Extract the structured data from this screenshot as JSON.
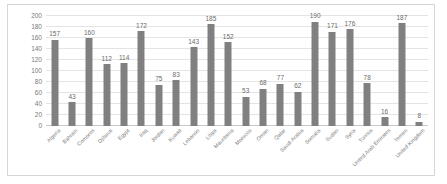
{
  "chart_data": {
    "type": "bar",
    "title": "",
    "subtitle": "",
    "xlabel": "",
    "ylabel": "",
    "ylim": [
      0,
      200
    ],
    "yticks": [
      0,
      20,
      40,
      60,
      80,
      100,
      120,
      140,
      160,
      180,
      200
    ],
    "grid": true,
    "legend": false,
    "legend_position": "none",
    "bar_color": "#808080",
    "categories": [
      "Algeria",
      "Bahrain",
      "Comoros",
      "Djibouti",
      "Egypt",
      "Iraq",
      "Jordan",
      "Kuwait",
      "Lebanon",
      "Libya",
      "Mauritania",
      "Morocco",
      "Oman",
      "Qatar",
      "Saudi Arabia",
      "Somalia",
      "Sudan",
      "Syria",
      "Tunisia",
      "United Arab Emirates",
      "Yemen",
      "United Kingdom"
    ],
    "values": [
      157,
      43,
      160,
      112,
      114,
      172,
      75,
      83,
      143,
      185,
      152,
      53,
      68,
      77,
      62,
      190,
      171,
      176,
      78,
      16,
      187,
      8
    ],
    "data_labels": [
      "157",
      "43",
      "160",
      "112",
      "114",
      "172",
      "75",
      "83",
      "143",
      "185",
      "152",
      "53",
      "68",
      "77",
      "62",
      "190",
      "171",
      "176",
      "78",
      "16",
      "187",
      "8"
    ]
  }
}
